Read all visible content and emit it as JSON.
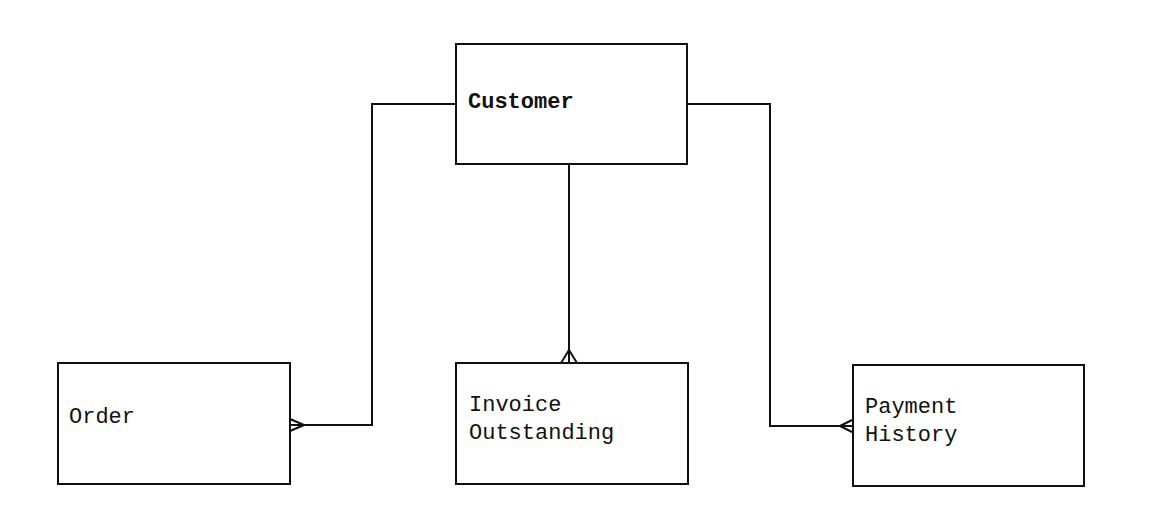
{
  "diagram": {
    "type": "entity-relationship",
    "colors": {
      "line": "#111111",
      "background": "#ffffff"
    },
    "entities": [
      {
        "id": "customer",
        "label": "Customer"
      },
      {
        "id": "order",
        "label": "Order"
      },
      {
        "id": "invoice_outstanding",
        "label_line1": "Invoice",
        "label_line2": "Outstanding"
      },
      {
        "id": "payment_history",
        "label_line1": "Payment",
        "label_line2": "History"
      }
    ],
    "relationships": [
      {
        "from": "Customer",
        "to": "Order",
        "cardinality": "one-to-many"
      },
      {
        "from": "Customer",
        "to": "Invoice Outstanding",
        "cardinality": "one-to-many"
      },
      {
        "from": "Customer",
        "to": "Payment History",
        "cardinality": "one-to-many"
      }
    ]
  }
}
